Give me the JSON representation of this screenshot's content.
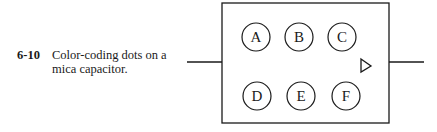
{
  "figure": {
    "number": "6-10",
    "caption": "Color-coding dots on a mica capacitor.",
    "dots": [
      {
        "label": "A",
        "row": "top",
        "cx": 256,
        "cy": 37
      },
      {
        "label": "B",
        "row": "top",
        "cx": 299,
        "cy": 37
      },
      {
        "label": "C",
        "row": "top",
        "cx": 342,
        "cy": 37
      },
      {
        "label": "D",
        "row": "bottom",
        "cx": 257,
        "cy": 96
      },
      {
        "label": "E",
        "row": "bottom",
        "cx": 301,
        "cy": 96
      },
      {
        "label": "F",
        "row": "bottom",
        "cx": 346,
        "cy": 96
      }
    ],
    "orientation_marker": "right-pointing triangle"
  }
}
